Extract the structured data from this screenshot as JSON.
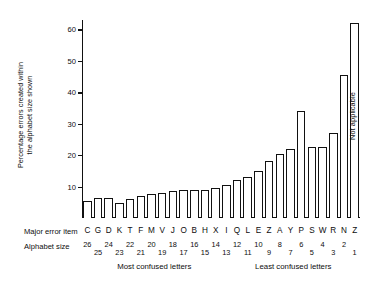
{
  "chart_data": {
    "type": "bar",
    "title": "",
    "ylabel_lines": [
      "Percentage errors created within",
      "the alphabet size shown"
    ],
    "xlabel": "",
    "ylim": [
      0,
      63
    ],
    "yticks": [
      10,
      20,
      30,
      40,
      50,
      60
    ],
    "ytick_labels": [
      "10",
      "20",
      "30",
      "40",
      "50",
      "60"
    ],
    "grid": false,
    "legend": null,
    "row_labels": {
      "major_error_item": "Major error item",
      "alphabet_size": "Alphabet size"
    },
    "categories": [
      "C",
      "G",
      "D",
      "K",
      "T",
      "F",
      "M",
      "V",
      "J",
      "O",
      "B",
      "H",
      "X",
      "I",
      "Q",
      "L",
      "E",
      "Z",
      "A",
      "Y",
      "P",
      "S",
      "W",
      "R",
      "N",
      "Z"
    ],
    "alphabet_sizes": [
      26,
      25,
      24,
      23,
      22,
      21,
      20,
      19,
      18,
      17,
      16,
      15,
      14,
      13,
      12,
      11,
      10,
      9,
      8,
      7,
      6,
      5,
      4,
      3,
      2,
      1
    ],
    "values": [
      5.5,
      6.5,
      6.5,
      4.8,
      6.0,
      7.0,
      7.5,
      8.0,
      8.5,
      9.0,
      9.0,
      9.0,
      9.5,
      10.5,
      12.0,
      13.0,
      15.0,
      18.0,
      20.5,
      22.0,
      34.0,
      22.5,
      22.5,
      27.0,
      45.5,
      62.0
    ],
    "annotations": [
      {
        "text": "Not applicable",
        "on_category": "Z",
        "index": 25,
        "rotation": -90
      }
    ],
    "axis_captions": [
      {
        "text": "Most confused letters",
        "side": "left"
      },
      {
        "text": "Least confused letters",
        "side": "right"
      }
    ]
  }
}
